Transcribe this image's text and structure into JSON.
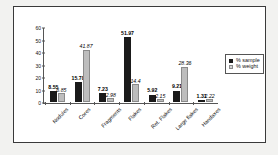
{
  "chart_data": {
    "type": "bar",
    "title": "",
    "xlabel": "",
    "ylabel": "",
    "ylim": [
      0,
      60
    ],
    "yticks": [
      0,
      10,
      20,
      30,
      40,
      50,
      60
    ],
    "grid": false,
    "legend_position": "right",
    "categories": [
      "Nodules",
      "Cores",
      "Fragments",
      "Flakes",
      "Ret. Flakes",
      "Large flakes",
      "Handaxes"
    ],
    "series": [
      {
        "name": "% sample",
        "color": "#1a1a1a",
        "values": [
          8.55,
          15.78,
          7.23,
          51.97,
          5.92,
          9.21,
          1.31
        ],
        "labels": [
          "8.55",
          "15.78",
          "7.23",
          "51.97",
          "5.92",
          "9.21",
          "1.31"
        ]
      },
      {
        "name": "% weight",
        "color": "#bdbdbd",
        "values": [
          6.85,
          41.87,
          2.98,
          14.4,
          2.15,
          28.36,
          2.22
        ],
        "labels": [
          "6.85",
          "41.87",
          "2.98",
          "14.4",
          "2.15",
          "28.36",
          "2.22"
        ]
      }
    ]
  },
  "legend": {
    "items": [
      {
        "label": "% sample",
        "swatch": "black-square-icon"
      },
      {
        "label": "% weight",
        "swatch": "gray-square-icon"
      }
    ]
  }
}
